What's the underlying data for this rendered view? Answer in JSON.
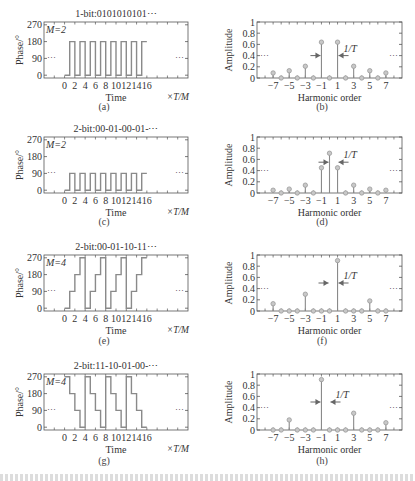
{
  "figure": {
    "captions": [
      "(a)",
      "(b)",
      "(c)",
      "(d)",
      "(e)",
      "(f)",
      "(g)",
      "(h)"
    ]
  },
  "chart_data": [
    {
      "id": "a",
      "type": "line",
      "step": true,
      "title": "1-bit:0101010101⋯",
      "annotation": "M=2",
      "xlabel": "Time",
      "xunit": "×T/M",
      "ylabel": "Phase/°",
      "xticks": [
        0,
        2,
        4,
        6,
        8,
        10,
        12,
        14,
        16
      ],
      "yticks": [
        0,
        90,
        180,
        270
      ],
      "xlim": [
        -4,
        24
      ],
      "ylim": [
        -15,
        285
      ],
      "x": [
        0,
        1,
        1,
        2,
        2,
        3,
        3,
        4,
        4,
        5,
        5,
        6,
        6,
        7,
        7,
        8,
        8,
        9,
        9,
        10,
        10,
        11,
        11,
        12,
        12,
        13,
        13,
        14,
        14,
        15,
        15,
        16
      ],
      "y": [
        0,
        0,
        180,
        180,
        0,
        0,
        180,
        180,
        0,
        0,
        180,
        180,
        0,
        0,
        180,
        180,
        0,
        0,
        180,
        180,
        0,
        0,
        180,
        180,
        0,
        0,
        180,
        180,
        0,
        0,
        180,
        180
      ],
      "ellipsis_left": "⋯",
      "ellipsis_right": "⋯"
    },
    {
      "id": "b",
      "type": "stem",
      "xlabel": "Harmonic order",
      "ylabel": "Amplitude",
      "xticks": [
        -7,
        -5,
        -3,
        -1,
        1,
        3,
        5,
        7
      ],
      "yticks": [
        0,
        0.2,
        0.4,
        0.6,
        0.8,
        1
      ],
      "yticklabels": [
        "0",
        "0.2",
        "0.4",
        "0.6",
        "0.8",
        "1"
      ],
      "xlim": [
        -9,
        9
      ],
      "ylim": [
        0,
        1
      ],
      "x": [
        -7,
        -6,
        -5,
        -4,
        -3,
        -2,
        -1,
        0,
        1,
        2,
        3,
        4,
        5,
        6,
        7
      ],
      "values": [
        0.09,
        0,
        0.13,
        0,
        0.21,
        0,
        0.64,
        0,
        0.64,
        0,
        0.21,
        0,
        0.13,
        0,
        0.09
      ],
      "annotation": "1/T",
      "arrows_between": [
        -1,
        1
      ],
      "arrow_y": 0.4
    },
    {
      "id": "c",
      "type": "line",
      "step": true,
      "title": "2-bit:00-01-00-01-⋯",
      "annotation": "M=2",
      "xlabel": "Time",
      "xunit": "×T/M",
      "ylabel": "Phase/°",
      "xticks": [
        0,
        2,
        4,
        6,
        8,
        10,
        12,
        14,
        16
      ],
      "yticks": [
        0,
        90,
        180,
        270
      ],
      "xlim": [
        -4,
        24
      ],
      "ylim": [
        -15,
        285
      ],
      "x": [
        0,
        1,
        1,
        2,
        2,
        3,
        3,
        4,
        4,
        5,
        5,
        6,
        6,
        7,
        7,
        8,
        8,
        9,
        9,
        10,
        10,
        11,
        11,
        12,
        12,
        13,
        13,
        14,
        14,
        15,
        15,
        16
      ],
      "y": [
        0,
        0,
        90,
        90,
        0,
        0,
        90,
        90,
        0,
        0,
        90,
        90,
        0,
        0,
        90,
        90,
        0,
        0,
        90,
        90,
        0,
        0,
        90,
        90,
        0,
        0,
        90,
        90,
        0,
        0,
        90,
        90
      ],
      "ellipsis_left": "⋯",
      "ellipsis_right": "⋯"
    },
    {
      "id": "d",
      "type": "stem",
      "xlabel": "Harmonic order",
      "ylabel": "Amplitude",
      "xticks": [
        -7,
        -5,
        -3,
        -1,
        1,
        3,
        5,
        7
      ],
      "yticks": [
        0,
        0.2,
        0.4,
        0.6,
        0.8,
        1
      ],
      "yticklabels": [
        "0",
        "0.2",
        "0.4",
        "0.6",
        "0.8",
        "1"
      ],
      "xlim": [
        -9,
        9
      ],
      "ylim": [
        0,
        1
      ],
      "x": [
        -7,
        -6,
        -5,
        -4,
        -3,
        -2,
        -1,
        0,
        1,
        2,
        3,
        4,
        5,
        6,
        7
      ],
      "values": [
        0.05,
        0,
        0.07,
        0,
        0.14,
        0,
        0.45,
        0.71,
        0.45,
        0,
        0.14,
        0,
        0.07,
        0,
        0.05
      ],
      "annotation": "1/T",
      "arrows_between": [
        0,
        1
      ],
      "arrow_y": 0.55
    },
    {
      "id": "e",
      "type": "line",
      "step": true,
      "title": "2-bit:00-01-10-11⋯",
      "annotation": "M=4",
      "xlabel": "Time",
      "xunit": "×T/M",
      "ylabel": "Phase/°",
      "xticks": [
        0,
        2,
        4,
        6,
        8,
        10,
        12,
        14,
        16
      ],
      "yticks": [
        0,
        90,
        180,
        270
      ],
      "xlim": [
        -4,
        24
      ],
      "ylim": [
        -15,
        285
      ],
      "x": [
        0,
        1,
        1,
        2,
        2,
        3,
        3,
        4,
        4,
        5,
        5,
        6,
        6,
        7,
        7,
        8,
        8,
        9,
        9,
        10,
        10,
        11,
        11,
        12,
        12,
        13,
        13,
        14,
        14,
        15,
        15,
        16
      ],
      "y": [
        0,
        0,
        90,
        90,
        180,
        180,
        270,
        270,
        0,
        0,
        90,
        90,
        180,
        180,
        270,
        270,
        0,
        0,
        90,
        90,
        180,
        180,
        270,
        270,
        0,
        0,
        90,
        90,
        180,
        180,
        270,
        270
      ],
      "ellipsis_left": "⋯",
      "ellipsis_right": "⋯"
    },
    {
      "id": "f",
      "type": "stem",
      "xlabel": "Harmonic order",
      "ylabel": "Amplitude",
      "xticks": [
        -7,
        -5,
        -3,
        -1,
        1,
        3,
        5,
        7
      ],
      "yticks": [
        0,
        0.2,
        0.4,
        0.6,
        0.8,
        1
      ],
      "yticklabels": [
        "0",
        "0.2",
        "0.4",
        "0.6",
        "0.8",
        "1"
      ],
      "xlim": [
        -9,
        9
      ],
      "ylim": [
        0,
        1
      ],
      "x": [
        -7,
        -6,
        -5,
        -4,
        -3,
        -2,
        -1,
        0,
        1,
        2,
        3,
        4,
        5,
        6,
        7
      ],
      "values": [
        0.13,
        0,
        0,
        0,
        0.3,
        0,
        0,
        0,
        0.9,
        0,
        0,
        0,
        0.18,
        0,
        0
      ],
      "annotation": "1/T",
      "arrows_between": [
        0,
        1
      ],
      "arrow_y": 0.5
    },
    {
      "id": "g",
      "type": "line",
      "step": true,
      "title": "2-bit:11-10-01-00-⋯",
      "annotation": "M=4",
      "xlabel": "Time",
      "xunit": "×T/M",
      "ylabel": "Phase/°",
      "xticks": [
        0,
        2,
        4,
        6,
        8,
        10,
        12,
        14,
        16
      ],
      "yticks": [
        0,
        90,
        180,
        270
      ],
      "xlim": [
        -4,
        24
      ],
      "ylim": [
        -15,
        285
      ],
      "x": [
        0,
        1,
        1,
        2,
        2,
        3,
        3,
        4,
        4,
        5,
        5,
        6,
        6,
        7,
        7,
        8,
        8,
        9,
        9,
        10,
        10,
        11,
        11,
        12,
        12,
        13,
        13,
        14,
        14,
        15,
        15,
        16
      ],
      "y": [
        270,
        270,
        180,
        180,
        90,
        90,
        0,
        0,
        270,
        270,
        180,
        180,
        90,
        90,
        0,
        0,
        270,
        270,
        180,
        180,
        90,
        90,
        0,
        0,
        270,
        270,
        180,
        180,
        90,
        90,
        0,
        0
      ],
      "ellipsis_left": "⋯",
      "ellipsis_right": "⋯"
    },
    {
      "id": "h",
      "type": "stem",
      "xlabel": "Harmonic order",
      "ylabel": "Amplitude",
      "xticks": [
        -7,
        -5,
        -3,
        -1,
        1,
        3,
        5,
        7
      ],
      "yticks": [
        0,
        0.2,
        0.4,
        0.6,
        0.8,
        1
      ],
      "yticklabels": [
        "0",
        "0.2",
        "0.4",
        "0.6",
        "0.8",
        "1"
      ],
      "xlim": [
        -9,
        9
      ],
      "ylim": [
        0,
        1
      ],
      "x": [
        -7,
        -6,
        -5,
        -4,
        -3,
        -2,
        -1,
        0,
        1,
        2,
        3,
        4,
        5,
        6,
        7
      ],
      "values": [
        0,
        0,
        0.18,
        0,
        0,
        0,
        0.9,
        0,
        0,
        0,
        0.3,
        0,
        0,
        0,
        0.13
      ],
      "annotation": "1/T",
      "arrows_between": [
        -1,
        0
      ],
      "arrow_y": 0.5
    }
  ],
  "colors": {
    "line": "#8a8a8a",
    "axis": "#555555",
    "text": "#333333",
    "marker": "#9a9a9a"
  }
}
